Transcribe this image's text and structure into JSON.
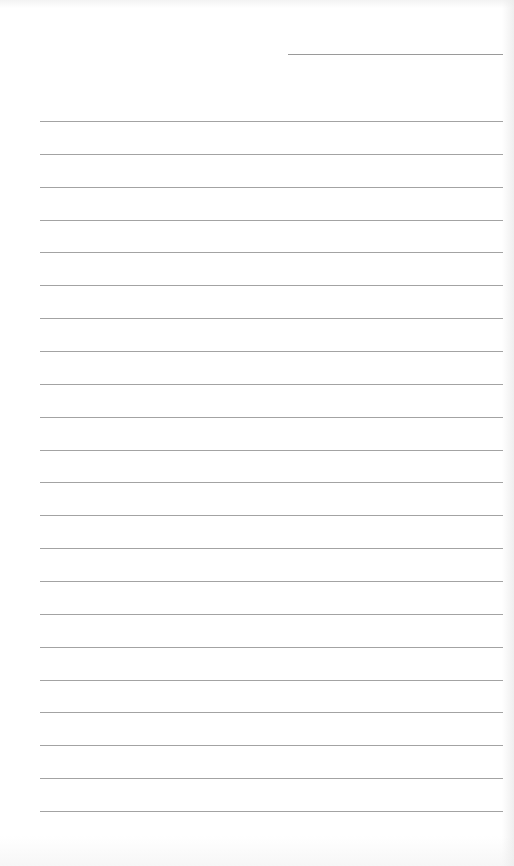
{
  "document": {
    "type": "lined-paper",
    "background_color": "#ffffff",
    "line_color": "#a3a3a3",
    "date_line": {
      "label": "",
      "left": 288,
      "top": 54,
      "width": 215
    },
    "ruled_lines": {
      "count": 22,
      "left": 40,
      "width": 463,
      "first_top": 121,
      "spacing": 32.86
    },
    "written_text": []
  }
}
